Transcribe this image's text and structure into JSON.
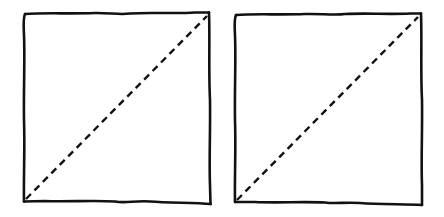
{
  "diagram": {
    "stroke_color": "#111111",
    "background_color": "#ffffff",
    "figures": [
      {
        "id": "left-square",
        "bounds": {
          "x1": 24,
          "y1": 12,
          "x2": 210,
          "y2": 203
        },
        "diagonal": {
          "from": "bottom-left",
          "to": "top-right",
          "style": "dashed"
        }
      },
      {
        "id": "right-square",
        "bounds": {
          "x1": 235,
          "y1": 13,
          "x2": 422,
          "y2": 205
        },
        "diagonal": {
          "from": "bottom-left",
          "to": "top-right",
          "style": "dashed"
        }
      }
    ]
  }
}
